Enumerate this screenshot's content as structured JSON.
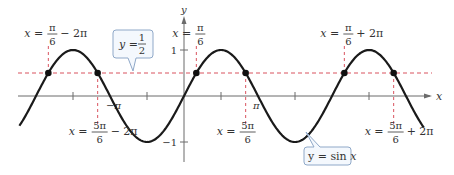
{
  "figure": {
    "width": 454,
    "height": 175,
    "colors": {
      "curve": "#1a1a1a",
      "axis": "#6b6b6b",
      "dashed": "#d9535f",
      "callout_border": "#8fa8c8",
      "callout_fill": "#f4f8fd",
      "text": "#333333"
    },
    "origin_px": {
      "x": 184,
      "y": 96
    },
    "scale_px": {
      "pi": 74,
      "unit_y": 46
    },
    "x_range_pi": [
      -2.224,
      3.24
    ],
    "axes": {
      "x_label": "x",
      "y_label": "y",
      "y_ticks": [
        {
          "value": 1,
          "label": "1"
        },
        {
          "value": -1,
          "label": "−1"
        }
      ],
      "x_ticks_pi": [
        -1.5,
        -0.5,
        0.5,
        1.5,
        2.5
      ],
      "x_tick_labels": [
        {
          "value_pi": -1,
          "label": "−π"
        },
        {
          "value_pi": 1,
          "label": "π"
        }
      ]
    },
    "horizontal_line": {
      "y": 0.5
    },
    "intersection_points_pi": [
      -1.8333,
      -1.1667,
      0.1667,
      0.8333,
      2.1667,
      2.8333
    ],
    "callouts": {
      "line": {
        "lhs": "y =",
        "num": "1",
        "den": "2"
      },
      "curve": {
        "text_lhs": "y = sin ",
        "text_var": "x"
      }
    },
    "annotations": {
      "top": [
        {
          "lhs": "x =",
          "num": "π",
          "den": "6",
          "suffix": "− 2π"
        },
        {
          "lhs": "x =",
          "num": "π",
          "den": "6",
          "suffix": ""
        },
        {
          "lhs": "x =",
          "num": "π",
          "den": "6",
          "suffix": "+ 2π"
        }
      ],
      "bottom": [
        {
          "lhs": "x =",
          "num": "5π",
          "den": "6",
          "suffix": "− 2π"
        },
        {
          "lhs": "x =",
          "num": "5π",
          "den": "6",
          "suffix": ""
        },
        {
          "lhs": "x =",
          "num": "5π",
          "den": "6",
          "suffix": "+ 2π"
        }
      ]
    }
  }
}
